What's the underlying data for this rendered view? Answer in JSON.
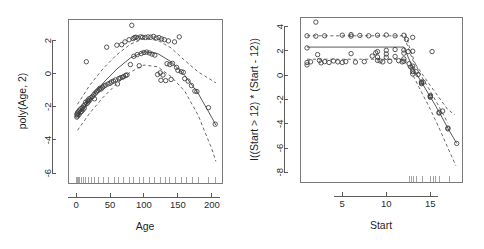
{
  "figure": {
    "title": "",
    "background": "#ffffff",
    "point_color": "#3b3b3b",
    "line_color": "#5a5a5a",
    "axis_color": "#4a4a4a"
  },
  "chart_data": [
    {
      "type": "scatter",
      "panel": "left",
      "title": "",
      "xlabel": "Age",
      "ylabel": "poly(Age, 2)",
      "xlim": [
        -12,
        215
      ],
      "ylim": [
        -6.6,
        3.3
      ],
      "xticks": [
        0,
        50,
        100,
        150,
        200
      ],
      "yticks": [
        2,
        0,
        -2,
        -4,
        -6
      ],
      "grid": false,
      "legend": "none",
      "marker": "open-circle",
      "points": [
        [
          1,
          -2.45
        ],
        [
          1,
          -2.62
        ],
        [
          2,
          -2.38
        ],
        [
          2,
          -2.55
        ],
        [
          3,
          -2.3
        ],
        [
          4,
          -2.48
        ],
        [
          5,
          -2.2
        ],
        [
          6,
          -2.35
        ],
        [
          7,
          -2.12
        ],
        [
          8,
          -2.28
        ],
        [
          9,
          -2.05
        ],
        [
          10,
          -2.18
        ],
        [
          11,
          -1.95
        ],
        [
          12,
          -2.08
        ],
        [
          13,
          -1.88
        ],
        [
          14,
          -1.72
        ],
        [
          15,
          0.72
        ],
        [
          16,
          -1.8
        ],
        [
          17,
          -1.62
        ],
        [
          18,
          -1.7
        ],
        [
          19,
          -1.52
        ],
        [
          20,
          -1.6
        ],
        [
          22,
          -1.45
        ],
        [
          24,
          -1.38
        ],
        [
          26,
          -1.28
        ],
        [
          27,
          -1.52
        ],
        [
          28,
          -1.18
        ],
        [
          30,
          -1.1
        ],
        [
          32,
          -1.02
        ],
        [
          34,
          -0.95
        ],
        [
          35,
          -0.88
        ],
        [
          37,
          -0.92
        ],
        [
          39,
          -0.82
        ],
        [
          41,
          -0.75
        ],
        [
          43,
          -0.7
        ],
        [
          45,
          1.6
        ],
        [
          47,
          -0.62
        ],
        [
          50,
          -0.58
        ],
        [
          52,
          -0.5
        ],
        [
          55,
          -0.45
        ],
        [
          58,
          -0.38
        ],
        [
          60,
          1.72
        ],
        [
          61,
          -0.62
        ],
        [
          63,
          -0.3
        ],
        [
          65,
          -0.25
        ],
        [
          67,
          1.75
        ],
        [
          68,
          -0.22
        ],
        [
          70,
          -0.18
        ],
        [
          72,
          1.92
        ],
        [
          73,
          -0.1
        ],
        [
          75,
          -0.08
        ],
        [
          78,
          2.05
        ],
        [
          80,
          0.55
        ],
        [
          82,
          2.92
        ],
        [
          84,
          2.12
        ],
        [
          85,
          1.05
        ],
        [
          86,
          2.18
        ],
        [
          88,
          2.2
        ],
        [
          90,
          1.15
        ],
        [
          91,
          2.15
        ],
        [
          93,
          0.48
        ],
        [
          95,
          2.22
        ],
        [
          96,
          1.22
        ],
        [
          98,
          2.2
        ],
        [
          100,
          1.28
        ],
        [
          102,
          2.18
        ],
        [
          104,
          1.3
        ],
        [
          106,
          2.22
        ],
        [
          108,
          1.25
        ],
        [
          110,
          2.2
        ],
        [
          112,
          1.18
        ],
        [
          114,
          2.25
        ],
        [
          116,
          1.12
        ],
        [
          118,
          2.15
        ],
        [
          120,
          -0.05
        ],
        [
          122,
          2.18
        ],
        [
          124,
          0.05
        ],
        [
          125,
          -0.4
        ],
        [
          126,
          2.1
        ],
        [
          128,
          -0.08
        ],
        [
          130,
          2.05
        ],
        [
          132,
          -0.42
        ],
        [
          134,
          0.6
        ],
        [
          136,
          1.98
        ],
        [
          138,
          0.55
        ],
        [
          140,
          -0.35
        ],
        [
          142,
          0.62
        ],
        [
          145,
          1.92
        ],
        [
          148,
          0.38
        ],
        [
          150,
          0.2
        ],
        [
          152,
          2.22
        ],
        [
          155,
          0.12
        ],
        [
          158,
          0.08
        ],
        [
          160,
          -0.3
        ],
        [
          165,
          -0.45
        ],
        [
          170,
          -0.72
        ],
        [
          175,
          -1.05
        ],
        [
          178,
          -1.08
        ],
        [
          195,
          -2.05
        ],
        [
          205,
          -3.05
        ]
      ],
      "fit_curve": {
        "label": "fitted quadratic",
        "style": "solid",
        "x": [
          2,
          20,
          40,
          60,
          80,
          100,
          120,
          140,
          160,
          180,
          200,
          206
        ],
        "y": [
          -2.62,
          -1.55,
          -0.55,
          0.28,
          0.95,
          1.32,
          1.22,
          0.72,
          -0.1,
          -1.2,
          -2.65,
          -3.1
        ]
      },
      "ci_upper": {
        "label": "upper confidence band",
        "style": "dashed",
        "x": [
          2,
          20,
          40,
          60,
          80,
          100,
          120,
          140,
          160,
          180,
          200,
          206
        ],
        "y": [
          -1.85,
          -0.7,
          0.32,
          1.15,
          1.78,
          2.12,
          2.02,
          1.55,
          0.8,
          0.1,
          -0.4,
          -0.55
        ]
      },
      "ci_lower": {
        "label": "lower confidence band",
        "style": "dashed",
        "x": [
          2,
          20,
          40,
          60,
          80,
          100,
          120,
          140,
          160,
          180,
          200,
          206
        ],
        "y": [
          -3.42,
          -2.38,
          -1.42,
          -0.6,
          0.1,
          0.52,
          0.42,
          -0.18,
          -1.05,
          -2.52,
          -4.55,
          -5.3
        ]
      },
      "rug_x": [
        1,
        2,
        3,
        5,
        8,
        11,
        14,
        18,
        22,
        27,
        33,
        40,
        48,
        56,
        63,
        70,
        78,
        85,
        93,
        100,
        108,
        116,
        124,
        131,
        138,
        146,
        155,
        163,
        172,
        180,
        195,
        205
      ]
    },
    {
      "type": "scatter",
      "panel": "right",
      "title": "",
      "xlabel": "Start",
      "ylabel": "I((Start > 12) * (Start - 12))",
      "xlim": [
        0.2,
        18.6
      ],
      "ylim": [
        -8.8,
        4.8
      ],
      "xticks": [
        5,
        10,
        15
      ],
      "yticks": [
        4,
        2,
        0,
        -2,
        -4,
        -6,
        -8
      ],
      "grid": false,
      "legend": "none",
      "marker": "open-circle",
      "points": [
        [
          1,
          3.25
        ],
        [
          1,
          2.25
        ],
        [
          1,
          1.05
        ],
        [
          1,
          0.85
        ],
        [
          1.4,
          1.1
        ],
        [
          2,
          4.38
        ],
        [
          2,
          3.22
        ],
        [
          2.2,
          1.7
        ],
        [
          2.4,
          1.22
        ],
        [
          2.6,
          1.02
        ],
        [
          3,
          3.25
        ],
        [
          3,
          1.12
        ],
        [
          3.5,
          1.05
        ],
        [
          4,
          1.18
        ],
        [
          4.5,
          1.1
        ],
        [
          5,
          3.3
        ],
        [
          5,
          1.05
        ],
        [
          5.4,
          1.12
        ],
        [
          6,
          3.22
        ],
        [
          6,
          3.35
        ],
        [
          6,
          1.78
        ],
        [
          6.5,
          1.08
        ],
        [
          7,
          3.28
        ],
        [
          7.5,
          1.12
        ],
        [
          8,
          3.25
        ],
        [
          8.4,
          1.58
        ],
        [
          8.8,
          1.85
        ],
        [
          9,
          3.3
        ],
        [
          9,
          1.95
        ],
        [
          9,
          1.5
        ],
        [
          9,
          1.22
        ],
        [
          9.3,
          1.18
        ],
        [
          9.6,
          1.1
        ],
        [
          10,
          3.32
        ],
        [
          10,
          2.05
        ],
        [
          10,
          1.75
        ],
        [
          10,
          1.48
        ],
        [
          10.4,
          1.15
        ],
        [
          11,
          3.25
        ],
        [
          11,
          2.12
        ],
        [
          11,
          1.55
        ],
        [
          11.4,
          1.2
        ],
        [
          11.8,
          1.1
        ],
        [
          12,
          3.3
        ],
        [
          12,
          2.08
        ],
        [
          12,
          1.82
        ],
        [
          12,
          1.35
        ],
        [
          12,
          1.15
        ],
        [
          12.3,
          2.95
        ],
        [
          12.5,
          1.95
        ],
        [
          12.6,
          0.95
        ],
        [
          12.8,
          0.68
        ],
        [
          13,
          3.12
        ],
        [
          13,
          1.98
        ],
        [
          13,
          0.75
        ],
        [
          13,
          0.52
        ],
        [
          13,
          0.3
        ],
        [
          13,
          0.1
        ],
        [
          13.4,
          0.28
        ],
        [
          13.6,
          0.05
        ],
        [
          14,
          -0.55
        ],
        [
          14,
          -0.62
        ],
        [
          14,
          -0.7
        ],
        [
          14.2,
          -0.58
        ],
        [
          15,
          -1.75
        ],
        [
          15,
          -1.82
        ],
        [
          15,
          -1.68
        ],
        [
          15.2,
          1.95
        ],
        [
          16,
          -3.05
        ],
        [
          16,
          -3.12
        ],
        [
          16.4,
          -2.95
        ],
        [
          17,
          -4.35
        ],
        [
          17,
          -4.42
        ],
        [
          18,
          -5.62
        ]
      ],
      "fit_curve": {
        "label": "fitted hinge line",
        "style": "solid",
        "x": [
          1,
          12,
          13,
          14,
          15,
          16,
          17,
          18
        ],
        "y": [
          2.32,
          2.32,
          0.62,
          -0.58,
          -1.78,
          -3.02,
          -4.38,
          -5.62
        ]
      },
      "ci_upper": {
        "label": "upper confidence band",
        "style": "dashed",
        "x": [
          1,
          12,
          13,
          14,
          15,
          16,
          17,
          17.8
        ],
        "y": [
          3.25,
          3.25,
          1.25,
          0.18,
          -0.85,
          -1.85,
          -2.85,
          -3.25
        ]
      },
      "ci_lower": {
        "label": "lower confidence band",
        "style": "dashed",
        "x": [
          1,
          12,
          13,
          14,
          15,
          16,
          17,
          17.9
        ],
        "y": [
          1.32,
          1.32,
          0.05,
          -1.4,
          -2.8,
          -4.35,
          -6.0,
          -7.45
        ]
      },
      "ci_extra": {
        "label": "upper band steep segment",
        "style": "dashed",
        "x": [
          12.2,
          12.6,
          13.2,
          14,
          15,
          16,
          17
        ],
        "y": [
          3.4,
          2.4,
          1.1,
          -0.1,
          -1.3,
          -2.6,
          -3.95
        ]
      },
      "rug_x": [
        12.6,
        12.9,
        13.1,
        13.4,
        14.1,
        15.0,
        15.4,
        15.6,
        16.1,
        17.2
      ]
    }
  ]
}
